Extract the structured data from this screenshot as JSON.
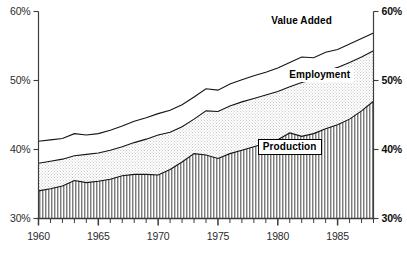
{
  "chart_data": {
    "type": "area",
    "title": "",
    "subtitle": "",
    "xlabel": "",
    "ylabel": "",
    "stacked": false,
    "grid": false,
    "legend_position": "inline-annotations",
    "xlim": [
      1960,
      1988
    ],
    "ylim": [
      30,
      60
    ],
    "y_tick_labels_left": [
      "60%",
      "50%",
      "40%",
      "30%"
    ],
    "y_tick_labels_right": [
      "60%",
      "50%",
      "40%",
      "30%"
    ],
    "y_ticks": [
      60,
      50,
      40,
      30
    ],
    "x_tick_labels": [
      "1960",
      "1965",
      "1970",
      "1975",
      "1980",
      "1985"
    ],
    "x_ticks_major": [
      1960,
      1965,
      1970,
      1975,
      1980,
      1985
    ],
    "x_ticks_minor_every": 1,
    "x": [
      1960,
      1961,
      1962,
      1963,
      1964,
      1965,
      1966,
      1967,
      1968,
      1969,
      1970,
      1971,
      1972,
      1973,
      1974,
      1975,
      1976,
      1977,
      1978,
      1979,
      1980,
      1981,
      1982,
      1983,
      1984,
      1985,
      1986,
      1987,
      1988
    ],
    "series": [
      {
        "name": "Value Added",
        "fill": "white",
        "values": [
          41.2,
          41.4,
          41.6,
          42.3,
          42.1,
          42.3,
          42.8,
          43.4,
          44.1,
          44.6,
          45.2,
          45.7,
          46.5,
          47.6,
          48.8,
          48.6,
          49.5,
          50.1,
          50.7,
          51.2,
          51.8,
          52.6,
          53.4,
          53.3,
          54.1,
          54.5,
          55.3,
          56.1,
          56.9
        ]
      },
      {
        "name": "Employment",
        "fill": "light-stipple",
        "values": [
          38.0,
          38.3,
          38.6,
          39.1,
          39.3,
          39.5,
          39.9,
          40.4,
          41.0,
          41.5,
          42.1,
          42.5,
          43.3,
          44.4,
          45.6,
          45.5,
          46.3,
          46.9,
          47.4,
          47.9,
          48.4,
          49.1,
          49.7,
          50.2,
          51.3,
          51.9,
          52.6,
          53.4,
          54.3
        ]
      },
      {
        "name": "Production",
        "fill": "vertical-hatch",
        "values": [
          34.0,
          34.3,
          34.7,
          35.5,
          35.2,
          35.4,
          35.7,
          36.2,
          36.4,
          36.4,
          36.3,
          37.1,
          38.2,
          39.4,
          39.2,
          38.7,
          39.4,
          39.9,
          40.4,
          40.9,
          41.4,
          42.4,
          41.9,
          42.3,
          43.0,
          43.6,
          44.4,
          45.6,
          47.0
        ]
      }
    ],
    "annotations": [
      {
        "text": "Value Added",
        "series": "Value Added",
        "boxed": false
      },
      {
        "text": "Employment",
        "series": "Employment",
        "boxed": false
      },
      {
        "text": "Production",
        "series": "Production",
        "boxed": true
      }
    ]
  },
  "labels": {
    "value_added": "Value Added",
    "employment": "Employment",
    "production": "Production",
    "y60_left": "60%",
    "y50_left": "50%",
    "y40_left": "40%",
    "y30_left": "30%",
    "y60_right": "60%",
    "y50_right": "50%",
    "y40_right": "40%",
    "y30_right": "30%",
    "x1960": "1960",
    "x1965": "1965",
    "x1970": "1970",
    "x1975": "1975",
    "x1980": "1980",
    "x1985": "1985"
  },
  "colors": {
    "axis": "#3c3c3c",
    "line": "#141414",
    "stipple": "#e3e3e3",
    "hatch": "#8e8e8e",
    "text": "#2b2b2b"
  }
}
